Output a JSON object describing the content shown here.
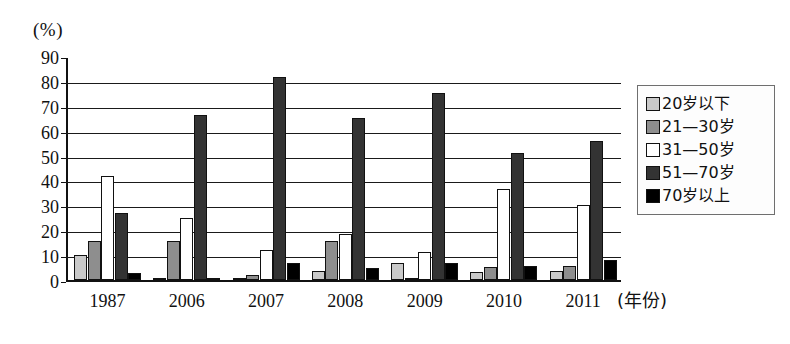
{
  "chart_data": {
    "type": "bar",
    "title": "",
    "subtitle": "",
    "xlabel": "(年份)",
    "ylabel": "(%)",
    "ylim": [
      0,
      90
    ],
    "ytick_step": 10,
    "yticks": [
      0,
      10,
      20,
      30,
      40,
      50,
      60,
      70,
      80,
      90
    ],
    "grid": "horizontal",
    "legend_position": "right",
    "categories": [
      "1987",
      "2006",
      "2007",
      "2008",
      "2009",
      "2010",
      "2011"
    ],
    "series": [
      {
        "name": "20岁以下",
        "color": "#c9c9c9",
        "values": [
          10,
          0.6,
          1,
          3.8,
          7,
          3.4,
          3.8
        ]
      },
      {
        "name": "21—30岁",
        "color": "#8e8e8e",
        "values": [
          16,
          16,
          2,
          16,
          0.7,
          5.4,
          5.5
        ]
      },
      {
        "name": "31—50岁",
        "color": "#ffffff",
        "values": [
          42,
          25,
          12,
          18.5,
          11.5,
          37,
          30.5
        ]
      },
      {
        "name": "51—70岁",
        "color": "#333333",
        "values": [
          27,
          67,
          82.5,
          65.5,
          76,
          51.5,
          56.5
        ]
      },
      {
        "name": "70岁以上",
        "color": "#000000",
        "values": [
          3,
          0.6,
          6.8,
          5,
          7,
          5.5,
          8.2
        ]
      }
    ]
  },
  "legend": {
    "items": [
      {
        "label": "20岁以下",
        "color": "#c9c9c9"
      },
      {
        "label": "21—30岁",
        "color": "#8e8e8e"
      },
      {
        "label": "31—50岁",
        "color": "#ffffff"
      },
      {
        "label": "51—70岁",
        "color": "#333333"
      },
      {
        "label": "70岁以上",
        "color": "#000000"
      }
    ]
  }
}
